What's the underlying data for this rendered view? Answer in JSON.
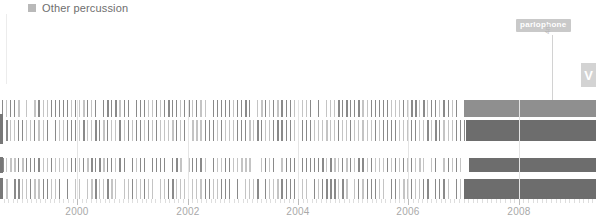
{
  "legend": {
    "items": [
      {
        "label": "Other percussion",
        "color": "#b9b9b9",
        "icon": "square-marker-icon"
      }
    ]
  },
  "annotation": {
    "badge_label": "parlophone",
    "badge_color": "#c9c9c9",
    "vertical_label": "4m",
    "leader_icon": "leader-line-icon"
  },
  "side_tab": {
    "label": "V",
    "icon": "chevron-collapse-icon",
    "color": "#d3d3d3"
  },
  "colors": {
    "bar": "#8a8a8a",
    "bar_light": "#c4c4c4",
    "solid_block": "#6d6d6d",
    "solid_block_light": "#8f8f8f",
    "gridline": "#e4e4e4",
    "axis_text": "#a9a9a9",
    "legend_text": "#6e6e6e"
  },
  "chart_data": {
    "type": "bar",
    "title": "",
    "subtitle": "",
    "xlabel": "",
    "ylabel": "",
    "grid": true,
    "legend_position": "top-left",
    "xlim": [
      1998.6,
      2009.4
    ],
    "x_tick_labels": [
      "2000",
      "2002",
      "2004",
      "2006",
      "2008"
    ],
    "x_tick_values": [
      2000,
      2002,
      2004,
      2006,
      2008
    ],
    "x_tick_positions_px": [
      97,
      201,
      305,
      409,
      513
    ],
    "minor_tick_interval_years": 0.0833,
    "series_name": "Other percussion",
    "lanes": [
      {
        "name": "lane-1",
        "top_px": 0,
        "height_px": 17,
        "solid_from_year": 2007.0,
        "solid_shade": "light",
        "bar_density": 0.55
      },
      {
        "name": "lane-2",
        "top_px": 20,
        "height_px": 21,
        "solid_from_year": 2007.05,
        "solid_shade": "dark",
        "bar_density": 0.62
      },
      {
        "name": "lane-3",
        "top_px": 58,
        "height_px": 14,
        "solid_from_year": 2007.1,
        "solid_shade": "dark",
        "bar_density": 0.5
      },
      {
        "name": "lane-4",
        "top_px": 79,
        "height_px": 20,
        "solid_from_year": 2007.0,
        "solid_shade": "dark",
        "bar_density": 0.58
      }
    ],
    "edge_stubs": [
      {
        "top_px": 14,
        "height_px": 30
      },
      {
        "top_px": 57,
        "height_px": 16
      },
      {
        "top_px": 78,
        "height_px": 21
      }
    ],
    "gridline_years": [
      2000,
      2002,
      2004,
      2006,
      2008
    ]
  }
}
